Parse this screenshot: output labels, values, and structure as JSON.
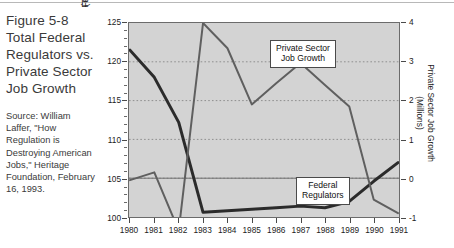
{
  "caption": {
    "title": "Figure 5-8 Total Federal Regulators vs. Private Sector Job Growth",
    "source": "Source: William Laffer, \"How Regulation is Destroying American Jobs,\" Heritage Foundation, February 16, 1993."
  },
  "callouts": {
    "private": {
      "line1": "Private Sector",
      "line2": "Job Growth"
    },
    "federal": {
      "line1": "Federal",
      "line2": "Regulators"
    }
  },
  "chart_data": {
    "type": "line",
    "title": "Total Federal Regulators vs. Private Sector Job Growth",
    "xlabel": "",
    "grid": "horizontal-dotted",
    "legend": "inline-callouts",
    "categories": [
      "1980",
      "1981",
      "1982",
      "1983",
      "1984",
      "1985",
      "1986",
      "1987",
      "1988",
      "1989",
      "1990",
      "1991"
    ],
    "x": [
      1980,
      1981,
      1982,
      1983,
      1984,
      1985,
      1986,
      1987,
      1988,
      1989,
      1990,
      1991
    ],
    "axes": {
      "left": {
        "label": "Federal Regulators",
        "label2": "(Thousands)",
        "ylim": [
          100,
          125
        ],
        "ticks": [
          100,
          105,
          110,
          115,
          120,
          125
        ],
        "ticklabels": [
          "100",
          "105",
          "110",
          "115",
          "120",
          "125"
        ]
      },
      "right": {
        "label": "Private Sector Job Growth",
        "label2": "(Millions)",
        "ylim": [
          -1,
          4
        ],
        "ticks": [
          -1,
          0,
          1,
          2,
          3,
          4
        ],
        "ticklabels": [
          "-1",
          "0",
          "1",
          "2",
          "3",
          "4"
        ]
      }
    },
    "series": [
      {
        "name": "Federal Regulators",
        "axis": "left",
        "units": "thousands",
        "color": "#2b2b2b",
        "width": 3,
        "values": [
          121.5,
          118.0,
          112.2,
          100.6,
          100.8,
          101.0,
          101.2,
          101.4,
          101.2,
          102.0,
          104.6,
          107.0
        ]
      },
      {
        "name": "Private Sector Job Growth",
        "axis": "right",
        "units": "millions",
        "color": "#5f5f5f",
        "width": 2,
        "values": [
          -0.05,
          0.15,
          -1.35,
          4.0,
          3.35,
          1.9,
          2.45,
          2.97,
          2.4,
          1.85,
          -0.55,
          -0.9
        ]
      }
    ]
  }
}
